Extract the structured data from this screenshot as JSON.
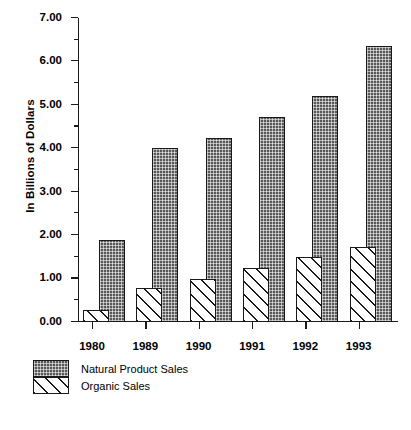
{
  "chart_data": {
    "type": "bar",
    "title": "",
    "xlabel": "",
    "ylabel": "In Billions of Dollars",
    "categories": [
      "1980",
      "1989",
      "1990",
      "1991",
      "1992",
      "1993"
    ],
    "series": [
      {
        "name": "Natural Product Sales",
        "values": [
          1.9,
          4.0,
          4.23,
          4.72,
          5.21,
          6.35
        ]
      },
      {
        "name": "Organic Sales",
        "values": [
          0.27,
          0.78,
          1.0,
          1.25,
          1.5,
          1.72
        ]
      }
    ],
    "ylim": [
      0.0,
      7.0
    ],
    "ytick_labels": [
      "0.00",
      "1.00",
      "2.00",
      "3.00",
      "4.00",
      "5.00",
      "6.00",
      "7.00"
    ],
    "ytick_values": [
      0,
      1,
      2,
      3,
      4,
      5,
      6,
      7
    ],
    "yminor_values": [
      0.5,
      1.5,
      2.5,
      3.5,
      4.5,
      5.5,
      6.5
    ],
    "grid": false,
    "legend_position": "below-left",
    "colors": {
      "natural_fill": "#595959",
      "organic_fill": "#ffffff",
      "outline": "#1a1a1a",
      "background": "#ffffff"
    }
  },
  "legend": {
    "items": [
      {
        "label": "Natural Product Sales",
        "pattern": "stipple-dark"
      },
      {
        "label": "Organic Sales",
        "pattern": "diagonal-hatch"
      }
    ]
  },
  "axis": {
    "y_title": "In Billions of Dollars"
  }
}
